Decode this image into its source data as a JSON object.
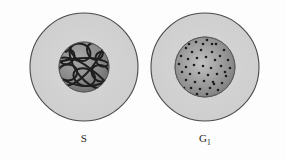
{
  "figure": {
    "background_color": "#fdfdfd",
    "cytoplasm_color": "#d2d2d2",
    "cytoplasm_stroke": "#4a4a4a",
    "nucleus_color": "#8a8a8a",
    "nucleus_edge_color": "#6a6a6a",
    "nucleus_highlight_color": "#b9b9b9",
    "chromatin_color": "#1e1e1e",
    "label_color": "#1c1c1c"
  },
  "cells": [
    {
      "id": "cell-s-phase",
      "label": "S",
      "label_sub": "",
      "label_full": "S",
      "nucleus_style": "tangled-chromatin-threads",
      "center_x": 84,
      "center_y": 67,
      "cell_radius": 54,
      "nucleus_radius": 25,
      "label_x": 84,
      "label_y": 142
    },
    {
      "id": "cell-g1-phase",
      "label": "G",
      "label_sub": "1",
      "label_full": "G1",
      "nucleus_style": "granular-dots",
      "center_x": 205,
      "center_y": 67,
      "cell_radius": 54,
      "nucleus_radius": 30,
      "label_x": 205,
      "label_y": 142
    }
  ],
  "chromatin_threads": {
    "description": "Tangled looping replicated chromosome threads inside S-phase nucleus",
    "stroke_width": 2.0,
    "paths": [
      "M 66 52 C 60 48, 56 55, 60 61 C 64 67, 72 64, 74 58 C 76 52, 70 47, 66 52 Z",
      "M 72 46 C 78 41, 88 44, 90 51 C 92 58, 85 63, 79 60 C 73 57, 68 50, 72 46 Z",
      "M 90 44 C 97 41, 104 46, 103 53 C 102 60, 94 62, 90 57 C 86 52, 86 46, 90 44 Z",
      "M 100 52 C 107 50, 112 56, 110 62 C 108 68, 100 68, 97 63 C 94 58, 96 53, 100 52 Z",
      "M 62 66 C 56 70, 58 78, 65 80 C 72 82, 78 77, 77 71 C 76 65, 68 63, 62 66 Z",
      "M 76 70 C 84 66, 94 70, 95 77 C 96 84, 88 88, 81 85 C 74 82, 71 74, 76 70 Z",
      "M 95 66 C 103 63, 110 68, 109 75 C 108 81, 100 84, 95 79 C 90 74, 91 68, 95 66 Z",
      "M 60 58 C 70 56, 82 62, 92 70 C 100 76, 106 82, 108 86",
      "M 64 80 C 74 86, 88 88, 100 84 C 106 82, 110 78, 111 74",
      "M 70 44 C 68 54, 72 66, 80 76 C 86 83, 94 88, 100 89",
      "M 104 46 C 100 56, 94 66, 86 74 C 78 82, 70 86, 64 86",
      "M 58 62 C 66 60, 76 58, 86 58 C 96 58, 104 60, 110 64"
    ]
  },
  "granule_dots": {
    "description": "Scattered dark chromatin granules in G1 nucleus",
    "radius": 1.3,
    "points": [
      [
        196,
        42
      ],
      [
        207,
        40
      ],
      [
        216,
        44
      ],
      [
        186,
        48
      ],
      [
        224,
        50
      ],
      [
        192,
        52
      ],
      [
        201,
        50
      ],
      [
        212,
        52
      ],
      [
        220,
        56
      ],
      [
        181,
        56
      ],
      [
        188,
        59
      ],
      [
        197,
        58
      ],
      [
        206,
        57
      ],
      [
        215,
        60
      ],
      [
        228,
        60
      ],
      [
        179,
        64
      ],
      [
        186,
        67
      ],
      [
        194,
        65
      ],
      [
        203,
        66
      ],
      [
        211,
        68
      ],
      [
        221,
        66
      ],
      [
        230,
        68
      ],
      [
        182,
        72
      ],
      [
        190,
        74
      ],
      [
        199,
        73
      ],
      [
        208,
        75
      ],
      [
        217,
        74
      ],
      [
        226,
        76
      ],
      [
        186,
        80
      ],
      [
        195,
        82
      ],
      [
        204,
        81
      ],
      [
        213,
        82
      ],
      [
        222,
        83
      ],
      [
        191,
        88
      ],
      [
        200,
        89
      ],
      [
        210,
        88
      ],
      [
        218,
        90
      ],
      [
        197,
        94
      ],
      [
        207,
        94
      ],
      [
        214,
        84
      ],
      [
        203,
        44
      ],
      [
        189,
        44
      ],
      [
        225,
        72
      ],
      [
        184,
        88
      ],
      [
        212,
        44
      ]
    ]
  }
}
